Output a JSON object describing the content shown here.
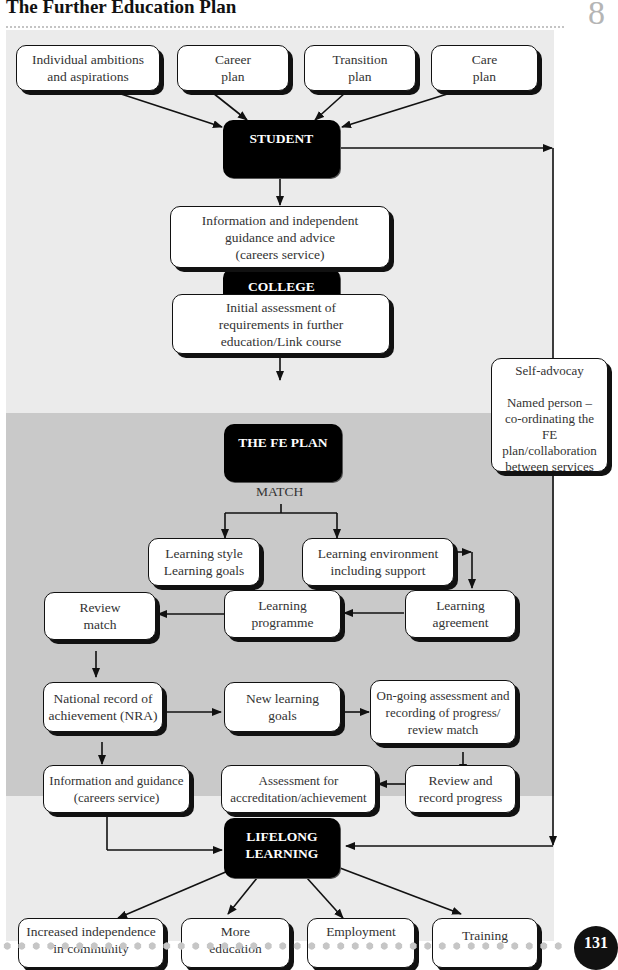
{
  "header": {
    "title": "The Further Education Plan",
    "chapter_number": "8"
  },
  "diagram": {
    "inputs": [
      {
        "id": "ambitions",
        "label": "Individual ambitions\nand aspirations"
      },
      {
        "id": "career",
        "label": "Career\nplan"
      },
      {
        "id": "transition",
        "label": "Transition\nplan"
      },
      {
        "id": "care",
        "label": "Care\nplan"
      }
    ],
    "hubs": {
      "student": "STUDENT",
      "college": "COLLEGE",
      "fe_plan": "THE FE PLAN",
      "lifelong": "LIFELONG\nLEARNING"
    },
    "nodes": {
      "info_guidance_advice": "Information and independent\nguidance and advice\n(careers service)",
      "initial_assessment": "Initial assessment of\nrequirements in further\neducation/Link course",
      "self_advocacy": "Self-advocay\n\nNamed person –\nco-ordinating the\nFE\nplan/collaboration\nbetween services",
      "match_label": "MATCH",
      "learning_style": "Learning style\nLearning goals",
      "learning_environment": "Learning environment\nincluding support",
      "review_match": "Review\nmatch",
      "learning_programme": "Learning\nprogramme",
      "learning_agreement": "Learning\nagreement",
      "nra": "National record of\nachievement (NRA)",
      "new_learning_goals": "New learning\ngoals",
      "ongoing_assessment": "On-going assessment and\nrecording of progress/\nreview match",
      "info_guidance_careers": "Information and guidance\n(careers service)",
      "assessment_accreditation": "Assessment for\naccreditation/achievement",
      "review_record": "Review and\nrecord progress"
    },
    "outcomes": [
      {
        "id": "independence",
        "label": "Increased independence\nin community"
      },
      {
        "id": "education",
        "label": "More\neducation"
      },
      {
        "id": "employment",
        "label": "Employment"
      },
      {
        "id": "training",
        "label": "Training"
      }
    ]
  },
  "footer": {
    "page_number": "131"
  }
}
